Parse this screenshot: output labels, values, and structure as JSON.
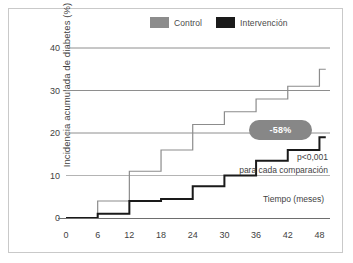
{
  "legend": {
    "items": [
      {
        "label": "Control",
        "color": "#8c8c8c",
        "icon": "legend-swatch-control"
      },
      {
        "label": "Intervención",
        "color": "#1a1a1a",
        "icon": "legend-swatch-intervencion"
      }
    ]
  },
  "annotations": {
    "badge": "-58%",
    "p_value": "p<0,001",
    "comparison": "para cada comparación",
    "time_axis": "Tiempo (meses)"
  },
  "chart_data": {
    "type": "line",
    "subtype": "step",
    "title": "",
    "xlabel": "Tiempo (meses)",
    "ylabel": "Incidencia acumulada de diabetes (%)",
    "xlim": [
      0,
      50
    ],
    "ylim": [
      0,
      40
    ],
    "xticks": [
      0,
      6,
      12,
      18,
      24,
      30,
      36,
      42,
      48
    ],
    "yticks": [
      0,
      10,
      20,
      30,
      40
    ],
    "grid": "horizontal",
    "legend_position": "top-right",
    "x": [
      0,
      6,
      12,
      18,
      24,
      30,
      36,
      42,
      48
    ],
    "series": [
      {
        "name": "Control",
        "color": "#8c8c8c",
        "values": [
          0,
          4,
          11,
          16,
          22,
          25,
          28,
          31,
          35
        ]
      },
      {
        "name": "Intervención",
        "color": "#1a1a1a",
        "values": [
          0,
          1,
          4,
          4.5,
          7.5,
          10,
          13.5,
          16,
          19
        ]
      }
    ],
    "annotations": [
      {
        "text": "-58%",
        "x": 38,
        "y": 20,
        "style": "pill"
      },
      {
        "text": "p<0,001",
        "x": 46,
        "y": 11
      },
      {
        "text": "para cada comparación",
        "x": 46,
        "y": 9
      }
    ]
  }
}
